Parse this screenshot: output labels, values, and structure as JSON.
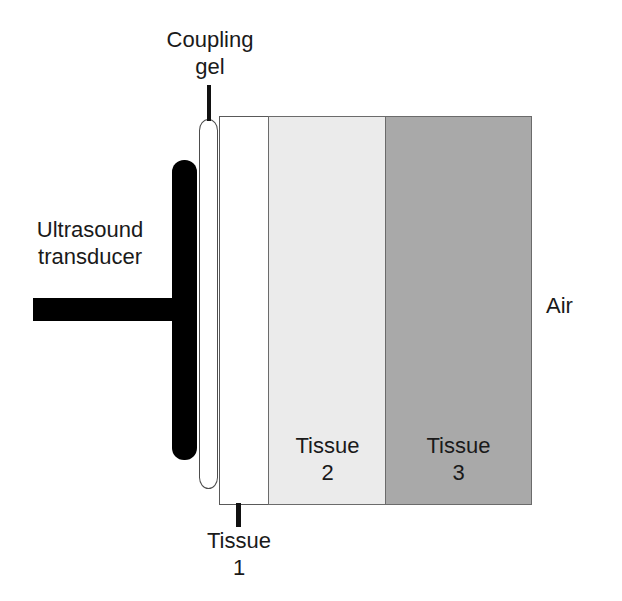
{
  "diagram": {
    "width": 622,
    "height": 601,
    "background_color": "#ffffff"
  },
  "labels": {
    "coupling_gel": "Coupling\ngel",
    "ultrasound_transducer": "Ultrasound\ntransducer",
    "tissue1": "Tissue\n1",
    "tissue2": "Tissue\n2",
    "tissue3": "Tissue\n3",
    "air": "Air"
  },
  "regions": [
    {
      "name": "tissue-1",
      "label": "Tissue 1",
      "fill_color": "#ffffff",
      "border_color": "#595959"
    },
    {
      "name": "tissue-2",
      "label": "Tissue 2",
      "fill_color": "#ebebeb",
      "border_color": "#6b6b6b"
    },
    {
      "name": "tissue-3",
      "label": "Tissue 3",
      "fill_color": "#a9a9a9",
      "border_color": "#6b6b6b"
    }
  ],
  "components": {
    "transducer_color": "#000000",
    "coupling_gel_fill": "#ffffff",
    "coupling_gel_border": "#4d4d4d",
    "leader_line_color": "#111111",
    "text_color": "#1a1a1a"
  }
}
